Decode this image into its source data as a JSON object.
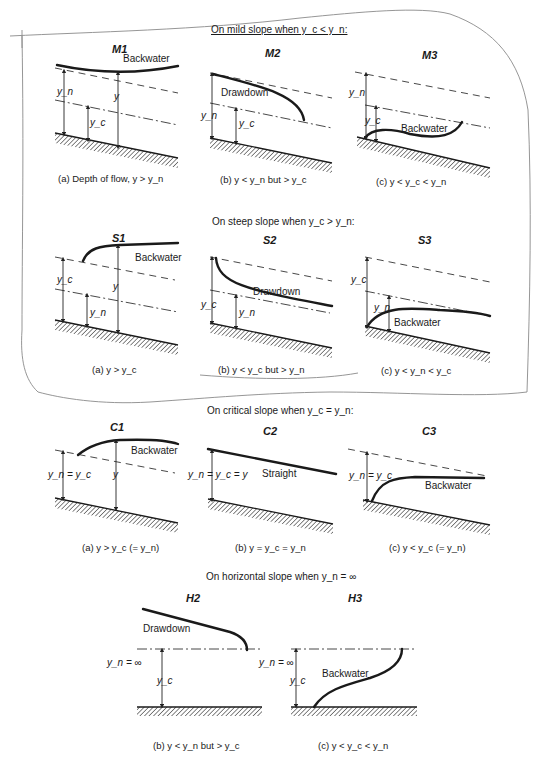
{
  "sections": {
    "mild": {
      "header": "On mild slope when y_c < y_n:",
      "panels": [
        {
          "title": "M1",
          "profile_label": "Backwater",
          "caption": "(a)  Depth of flow, y > y_n",
          "depths": [
            "y_n",
            "y_c",
            "y"
          ]
        },
        {
          "title": "M2",
          "profile_label": "Drawdown",
          "caption": "(b)  y < y_n but > y_c",
          "depths": [
            "y_n",
            "y_c"
          ]
        },
        {
          "title": "M3",
          "profile_label": "Backwater",
          "caption": "(c)  y < y_c < y_n",
          "depths": [
            "y_n",
            "y_c"
          ]
        }
      ]
    },
    "steep": {
      "header": "On steep slope when y_c > y_n:",
      "panels": [
        {
          "title": "S1",
          "profile_label": "Backwater",
          "caption": "(a)  y > y_c",
          "depths": [
            "y_c",
            "y_n",
            "y"
          ]
        },
        {
          "title": "S2",
          "profile_label": "Drawdown",
          "caption": "(b)  y < y_c but > y_n",
          "depths": [
            "y_c",
            "y_n"
          ]
        },
        {
          "title": "S3",
          "profile_label": "Backwater",
          "caption": "(c)  y < y_n < y_c",
          "depths": [
            "y_c",
            "y_n"
          ]
        }
      ]
    },
    "critical": {
      "header": "On critical slope when y_c = y_n:",
      "panels": [
        {
          "title": "C1",
          "profile_label": "Backwater",
          "caption": "(a)  y > y_c (= y_n)",
          "depths": [
            "y_n = y_c",
            "y"
          ]
        },
        {
          "title": "C2",
          "profile_label": "Straight",
          "caption": "(b)  y = y_c = y_n",
          "depths": [
            "y_n = y_c = y"
          ]
        },
        {
          "title": "C3",
          "profile_label": "Backwater",
          "caption": "(c)  y < y_c (= y_n)",
          "depths": [
            "y_n = y_c"
          ]
        }
      ]
    },
    "horizontal": {
      "header": "On horizontal slope when y_n = ∞",
      "panels": [
        {
          "title": "H2",
          "profile_label": "Drawdown",
          "caption": "(b)  y < y_n but > y_c",
          "depths": [
            "y_n = ∞",
            "y_c"
          ]
        },
        {
          "title": "H3",
          "profile_label": "Backwater",
          "caption": "(c)  y < y_c < y_n",
          "depths": [
            "y_n = ∞",
            "y_c"
          ]
        }
      ]
    }
  },
  "legend": {
    "normal_depth_line": "dashed",
    "critical_depth_line": "dash-dot",
    "bed": "hatched"
  },
  "colors": {
    "ink": "#1a1a1a",
    "pencil_outline": "#8a8a8a",
    "background": "#ffffff"
  }
}
